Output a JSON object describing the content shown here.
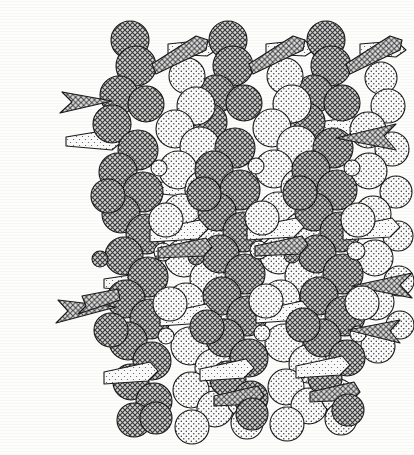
{
  "page": {
    "background_color": "#fdfdfb",
    "width": 414,
    "height": 455
  },
  "running_header": {
    "text": "HELIX STRUCTURE AND SUPRAHELICAL NODES",
    "note": "clipped at top edge of page crop",
    "rule_color": "#3b3b3b"
  },
  "figure": {
    "panel_label": "(a)",
    "caption": "",
    "type": "space-filling molecular model",
    "line_color": "#1a1a1a",
    "stroke_width": 1.1,
    "repeat_units": 3,
    "atom_types": [
      {
        "name": "dark-sphere",
        "label": "backbone atom",
        "fill_pattern": "dense cross-hatch stipple",
        "fill_color": "#8e8e8e",
        "stroke_color": "#1a1a1a"
      },
      {
        "name": "light-sphere",
        "label": "side-group atom",
        "fill_pattern": "sparse dot stipple",
        "fill_color": "#fbfbfb",
        "stroke_color": "#1a1a1a"
      },
      {
        "name": "dart-cone",
        "label": "substituent vector",
        "fill_pattern": "cross-hatch stipple",
        "fill_color": "#9a9a9a",
        "stroke_color": "#1a1a1a"
      },
      {
        "name": "plain-cone",
        "label": "bond vector",
        "fill_pattern": "light stipple",
        "fill_color": "#f2f2f2",
        "stroke_color": "#1a1a1a"
      }
    ],
    "columns": [
      {
        "name": "chain-left",
        "center_x": 131,
        "top_y": 28,
        "bottom_y": 430
      },
      {
        "name": "chain-middle",
        "center_x": 232,
        "top_y": 28,
        "bottom_y": 443
      },
      {
        "name": "chain-right",
        "center_x": 330,
        "top_y": 28,
        "bottom_y": 438
      }
    ],
    "bounds": {
      "x": 55,
      "y": 22,
      "width": 345,
      "height": 425
    }
  }
}
